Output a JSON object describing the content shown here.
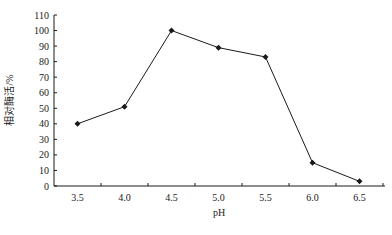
{
  "chart_data": {
    "type": "line",
    "title": "",
    "xlabel": "pH",
    "ylabel": "相对酶活/%",
    "categories": [
      "3.5",
      "4.0",
      "4.5",
      "5.0",
      "5.5",
      "6.0",
      "6.5"
    ],
    "x": [
      3.5,
      4.0,
      4.5,
      5.0,
      5.5,
      6.0,
      6.5
    ],
    "values": [
      40,
      51,
      100,
      89,
      83,
      15,
      3
    ],
    "series": [
      {
        "name": "相对酶活",
        "values": [
          40,
          51,
          100,
          89,
          83,
          15,
          3
        ],
        "marker": "diamond",
        "color": "#1a1a1a"
      }
    ],
    "ylim": [
      0,
      110
    ],
    "yticks": [
      0,
      10,
      20,
      30,
      40,
      50,
      60,
      70,
      80,
      90,
      100,
      110
    ],
    "grid": false,
    "legend": "none"
  },
  "colors": {
    "line": "#1a1a1a",
    "axis": "#1a1a1a",
    "caption": "#dcdcdc"
  }
}
